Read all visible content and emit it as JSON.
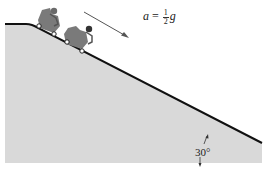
{
  "diagram": {
    "acceleration_label": {
      "variable": "a",
      "equals": "=",
      "fraction_numerator": "1",
      "fraction_denominator": "2",
      "unit_symbol": "g"
    },
    "angle_label": "30°",
    "colors": {
      "slope_fill": "#d9d9d9",
      "slope_line": "#111111",
      "arrow": "#555555",
      "cart": "#6f6f6f"
    },
    "elements": [
      "incline-surface",
      "roller-coaster-car-1",
      "roller-coaster-car-2",
      "acceleration-arrow",
      "angle-marker"
    ]
  }
}
